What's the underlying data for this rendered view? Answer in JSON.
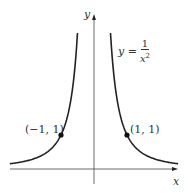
{
  "figure": {
    "axis_x_label": "x",
    "axis_y_label": "y",
    "equation": {
      "lhs": "y =",
      "numerator": "1",
      "denominator_base": "x",
      "denominator_exp": "2"
    },
    "points": [
      {
        "label": "(−1, 1)",
        "x": -1,
        "y": 1
      },
      {
        "label": "(1, 1)",
        "x": 1,
        "y": 1
      }
    ]
  },
  "chart_data": {
    "type": "line",
    "title": "",
    "function": "y = 1/x^2",
    "xlabel": "x",
    "ylabel": "y",
    "series": [
      {
        "name": "y = 1/x^2 (x<0)",
        "x": [
          -2.55,
          -2,
          -1.5,
          -1,
          -0.75,
          -0.5
        ],
        "y": [
          0.154,
          0.25,
          0.444,
          1,
          1.778,
          4.0
        ]
      },
      {
        "name": "y = 1/x^2 (x>0)",
        "x": [
          0.5,
          0.75,
          1,
          1.5,
          2,
          2.55
        ],
        "y": [
          4.0,
          1.778,
          1,
          0.444,
          0.25,
          0.154
        ]
      }
    ],
    "marked_points": [
      [
        -1,
        1
      ],
      [
        1,
        1
      ]
    ],
    "grid": false
  }
}
